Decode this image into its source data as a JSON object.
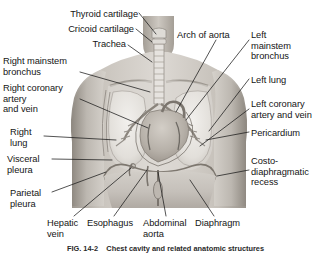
{
  "figure": {
    "caption_number": "FIG. 14-2",
    "caption_title": "Chest cavity and related anatomic structures",
    "style": "grayscale medical illustration"
  },
  "colors": {
    "background": "#ffffff",
    "label_text": "#151515",
    "leader_line": "#1a1a1a",
    "skin_light": "#d8d4cf",
    "skin_mid": "#b5b0a9",
    "skin_dark": "#8d8881",
    "lung_fill": "#e8e6e2",
    "cavity_fill": "#cfcbc5",
    "heart_fill": "#b9b3ab",
    "vessel_dark": "#6e6a64"
  },
  "labels": {
    "left": [
      {
        "id": "thyroid-cartilage",
        "text": "Thyroid cartilage",
        "x": 66,
        "y": 10,
        "align": "right",
        "anchor_x": 143,
        "anchor_y": 37
      },
      {
        "id": "cricoid-cartilage",
        "text": "Cricoid cartilage",
        "x": 70,
        "y": 25,
        "align": "right",
        "anchor_x": 146,
        "anchor_y": 50
      },
      {
        "id": "trachea",
        "text": "Trachea",
        "x": 98,
        "y": 40,
        "align": "right",
        "anchor_x": 150,
        "anchor_y": 66
      },
      {
        "id": "right-mainstem-bronchus",
        "text": "Right mainstem\nbronchus",
        "x": 4,
        "y": 57,
        "align": "right",
        "anchor_x": 148,
        "anchor_y": 105
      },
      {
        "id": "right-coronary-artery-vein",
        "text": "Right coronary\nartery\nand vein",
        "x": 6,
        "y": 84,
        "align": "right",
        "anchor_x": 148,
        "anchor_y": 140
      },
      {
        "id": "right-lung",
        "text": "Right\nlung",
        "x": 11,
        "y": 128,
        "align": "right",
        "anchor_x": 116,
        "anchor_y": 142
      },
      {
        "id": "visceral-pleura",
        "text": "Visceral\npleura",
        "x": 8,
        "y": 155,
        "align": "right",
        "anchor_x": 110,
        "anchor_y": 165
      },
      {
        "id": "parietal-pleura",
        "text": "Parietal\npleura",
        "x": 11,
        "y": 189,
        "align": "right",
        "anchor_x": 106,
        "anchor_y": 176
      }
    ],
    "top": [
      {
        "id": "arch-of-aorta",
        "text": "Arch of aorta",
        "x": 178,
        "y": 31,
        "align": "left",
        "anchor_x": 172,
        "anchor_y": 120
      }
    ],
    "right": [
      {
        "id": "left-mainstem-bronchus",
        "text": "Left\nmainstem\nbronchus",
        "x": 252,
        "y": 31,
        "align": "left",
        "anchor_x": 182,
        "anchor_y": 123
      },
      {
        "id": "left-lung",
        "text": "Left lung",
        "x": 252,
        "y": 76,
        "align": "left",
        "anchor_x": 207,
        "anchor_y": 133
      },
      {
        "id": "left-coronary-artery-vein",
        "text": "Left coronary\nartery and vein",
        "x": 252,
        "y": 100,
        "align": "left",
        "anchor_x": 196,
        "anchor_y": 148
      },
      {
        "id": "pericardium",
        "text": "Pericardium",
        "x": 252,
        "y": 129,
        "align": "left",
        "anchor_x": 205,
        "anchor_y": 143
      },
      {
        "id": "costodiaphragmatic-recess",
        "text": "Costo-\ndiaphragmatic\nrecess",
        "x": 252,
        "y": 157,
        "align": "left",
        "anchor_x": 222,
        "anchor_y": 168
      }
    ],
    "bottom": [
      {
        "id": "hepatic-vein",
        "text": "Hepatic\nvein",
        "x": 48,
        "y": 219,
        "align": "left",
        "anchor_x": 132,
        "anchor_y": 168
      },
      {
        "id": "esophagus",
        "text": "Esophagus",
        "x": 88,
        "y": 219,
        "align": "left",
        "anchor_x": 146,
        "anchor_y": 166
      },
      {
        "id": "abdominal-aorta",
        "text": "Abdominal\naorta",
        "x": 144,
        "y": 219,
        "align": "left",
        "anchor_x": 156,
        "anchor_y": 166
      },
      {
        "id": "diaphragm",
        "text": "Diaphragm",
        "x": 196,
        "y": 219,
        "align": "left",
        "anchor_x": 183,
        "anchor_y": 180
      }
    ]
  }
}
